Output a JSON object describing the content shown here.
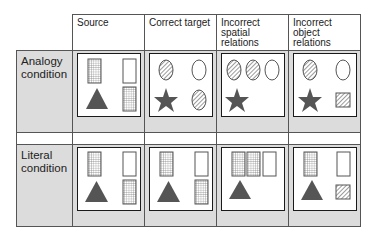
{
  "columns": [
    {
      "label": "Source"
    },
    {
      "label": "Correct target"
    },
    {
      "label": "Incorrect spatial relations"
    },
    {
      "label": "Incorrect object relations"
    }
  ],
  "rows": [
    {
      "label": "Analogy condition",
      "panels": [
        [
          "grid-rect tl",
          "empty-rect tr",
          "triangle bl",
          "grid-rect br"
        ],
        [
          "hatched-oval tl",
          "empty-oval tr",
          "star bl",
          "hatched-oval br"
        ],
        [
          "hatched-oval t1",
          "hatched-oval t2",
          "empty-oval t3",
          "star bl"
        ],
        [
          "hatched-oval tl",
          "empty-oval tr",
          "star bl",
          "hatched-square br"
        ]
      ]
    },
    {
      "label": "Literal condition",
      "panels": [
        [
          "grid-rect tl",
          "empty-rect tr",
          "triangle bl",
          "grid-rect br"
        ],
        [
          "grid-rect tl",
          "empty-rect tr",
          "triangle bl",
          "grid-rect br"
        ],
        [
          "grid-rect t1",
          "grid-rect t2",
          "empty-rect t3",
          "triangle bl"
        ],
        [
          "grid-rect tl",
          "empty-rect tr",
          "triangle bl",
          "hatched-square br"
        ]
      ]
    }
  ],
  "colors": {
    "cell_bg": "#dcdcdc",
    "shape_fill": "#555555",
    "line": "#555555"
  }
}
